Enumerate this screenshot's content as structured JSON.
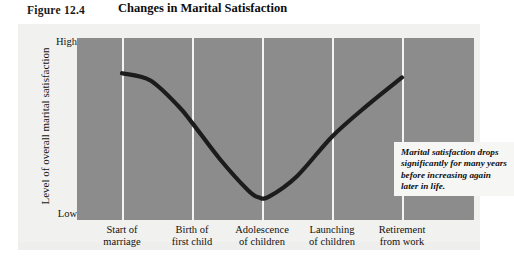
{
  "figure": {
    "number_prefix": "F",
    "number_rest": "IGURE",
    "number_full": "Figure 12.4",
    "number_value": "12.4",
    "title": "Changes in Marital Satisfaction"
  },
  "annotation": {
    "text": "Marital satisfaction drops significantly for many years before increasing again later in life."
  },
  "chart_data": {
    "type": "line",
    "title": "Changes in Marital Satisfaction",
    "xlabel": "",
    "ylabel": "Level of overall marital satisfaction",
    "grid": true,
    "legend": null,
    "ytick_labels": [
      "High",
      "Low"
    ],
    "ylim": [
      "Low",
      "High"
    ],
    "categories": [
      "Start of marriage",
      "Birth of first child",
      "Adolescence of children",
      "Launching of children",
      "Retirement from work"
    ],
    "category_lines": [
      [
        "Start of",
        "marriage"
      ],
      [
        "Birth of",
        "first child"
      ],
      [
        "Adolescence",
        "of children"
      ],
      [
        "Launching",
        "of children"
      ],
      [
        "Retirement",
        "from work"
      ]
    ],
    "x": [
      1,
      2,
      3,
      4,
      5
    ],
    "values": [
      0.97,
      0.62,
      0.1,
      0.52,
      0.94
    ],
    "series": [
      {
        "name": "Marital satisfaction",
        "values": [
          0.97,
          0.62,
          0.1,
          0.52,
          0.94
        ]
      }
    ],
    "curve_points": [
      {
        "x": 1.0,
        "y": 0.97
      },
      {
        "x": 1.4,
        "y": 0.92
      },
      {
        "x": 1.8,
        "y": 0.74
      },
      {
        "x": 2.0,
        "y": 0.62
      },
      {
        "x": 2.4,
        "y": 0.36
      },
      {
        "x": 2.8,
        "y": 0.14
      },
      {
        "x": 2.95,
        "y": 0.09
      },
      {
        "x": 3.1,
        "y": 0.095
      },
      {
        "x": 3.5,
        "y": 0.24
      },
      {
        "x": 4.0,
        "y": 0.52
      },
      {
        "x": 4.5,
        "y": 0.74
      },
      {
        "x": 5.0,
        "y": 0.94
      }
    ],
    "annotations": [
      "Marital satisfaction drops significantly for many years before increasing again later in life."
    ]
  },
  "colors": {
    "plot_background": "#8c8c8c",
    "panel_background": "#f1f1ef",
    "gridline": "#f4f4f2",
    "curve": "#1c1c1c",
    "annotation_background": "#f6f6f4",
    "text": "#111111"
  }
}
